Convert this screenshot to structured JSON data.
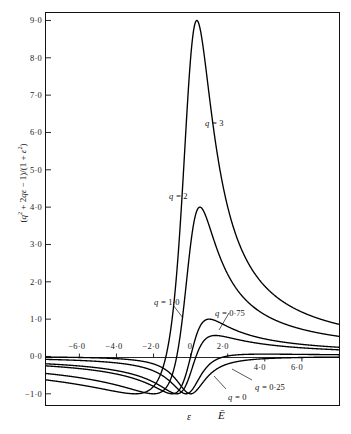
{
  "figure": {
    "background": "#ffffff",
    "axis_color": "#111111",
    "curve_color": "#000000"
  },
  "axis_titles": {
    "y_prefix": "(",
    "y_full": "(q² + 2qε − 1)/(1 + ε²)",
    "x_symbol_1": "ε",
    "x_symbol_2": "Ē"
  },
  "chart_data": {
    "type": "line",
    "title": "",
    "xlabel": "ε",
    "ylabel": "(q² + 2qε − 1)/(1 + ε²)",
    "xlim": [
      -7.8,
      8.0
    ],
    "ylim": [
      -1.3,
      9.2
    ],
    "grid": false,
    "legend_position": "inline-annotations",
    "x_ticks": [
      -6.0,
      -4.0,
      -2.0,
      0.0,
      2.0,
      4.0,
      6.0
    ],
    "x_tick_labels": [
      "−6·0",
      "−4·0",
      "−2·0",
      "0",
      "2·0",
      "4·0",
      "6·0"
    ],
    "y_ticks": [
      -1.0,
      0.0,
      1.0,
      2.0,
      3.0,
      4.0,
      5.0,
      6.0,
      7.0,
      8.0,
      9.0
    ],
    "y_tick_labels": [
      "−1·0",
      "0·0",
      "1·0",
      "2·0",
      "3·0",
      "4·0",
      "5·0",
      "6·0",
      "7·0",
      "8·0",
      "9·0"
    ],
    "formula": "(q^2 + 2*q*x - 1)/(1 + x^2)",
    "series": [
      {
        "name": "q = 3",
        "q": 3,
        "peak_x": 0.31,
        "peak_y": 8.94,
        "label": "q = 3",
        "label_x": 205,
        "label_y": 118
      },
      {
        "name": "q = 2",
        "q": 2,
        "peak_x": 0.41,
        "peak_y": 4.0,
        "label": "q = 2",
        "label_x": 169,
        "label_y": 191
      },
      {
        "name": "q = 1.0",
        "q": 1.0,
        "peak_x": 0.62,
        "peak_y": 1.0,
        "label": "q = 1·0",
        "label_x": 154,
        "label_y": 297
      },
      {
        "name": "q = 0.75",
        "q": 0.75,
        "peak_x": 0.72,
        "peak_y": 0.56,
        "label": "q = 0·75",
        "label_x": 215,
        "label_y": 308
      },
      {
        "name": "q = 0.25",
        "q": 0.25,
        "peak_x": 1.09,
        "peak_y": 0.09,
        "label": "q = 0·25",
        "label_x": 255,
        "label_y": 382
      },
      {
        "name": "q = 0",
        "q": 0,
        "peak_x": 1.0,
        "peak_y": 0.0,
        "label": "q = 0",
        "label_x": 228,
        "label_y": 392
      }
    ]
  }
}
